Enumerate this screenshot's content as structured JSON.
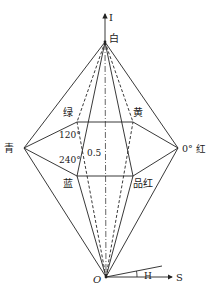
{
  "diagram": {
    "type": "HSI double-hexcone color model",
    "axes": {
      "intensity_label": "I",
      "saturation_label": "S",
      "hue_label": "H",
      "origin_label": "O"
    },
    "vertices": {
      "white": {
        "label": "白",
        "x": 105,
        "y": 42
      },
      "origin": {
        "label": "O",
        "x": 106,
        "y": 277
      },
      "red": {
        "label": "0° 红",
        "x": 178,
        "y": 148
      },
      "yellow": {
        "label": "黄",
        "x": 133,
        "y": 122
      },
      "green": {
        "label": "绿",
        "x": 77,
        "y": 122
      },
      "cyan": {
        "label": "青",
        "x": 24,
        "y": 148
      },
      "blue": {
        "label": "蓝",
        "x": 77,
        "y": 176
      },
      "magenta": {
        "label": "品红",
        "x": 133,
        "y": 176
      }
    },
    "annotations": {
      "angle_120": "120°",
      "angle_240": "240°",
      "mid_value": "0.5"
    },
    "colors": {
      "line": "#222222",
      "background": "#ffffff"
    }
  }
}
